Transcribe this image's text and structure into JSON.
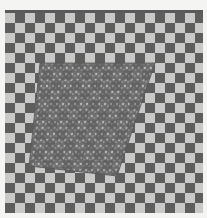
{
  "image": {
    "description": "Grayscale checkerboard with a perspective-warped textured patch",
    "width": 207,
    "height": 218
  },
  "colors": {
    "background": "#f4f4f2",
    "square_dark": "#5e5e5e",
    "square_light": "#c9c9c7",
    "patch_fill": "#6b6b6b",
    "patch_speck": "#d6d6d4",
    "patch_grid": "#7a7a7a"
  },
  "board": {
    "x": 5,
    "y": 10,
    "width": 198,
    "height": 203,
    "square_size": 10
  },
  "warped_patch": {
    "corners": [
      [
        40,
        63
      ],
      [
        155,
        63
      ],
      [
        117,
        176
      ],
      [
        29,
        166
      ]
    ]
  }
}
